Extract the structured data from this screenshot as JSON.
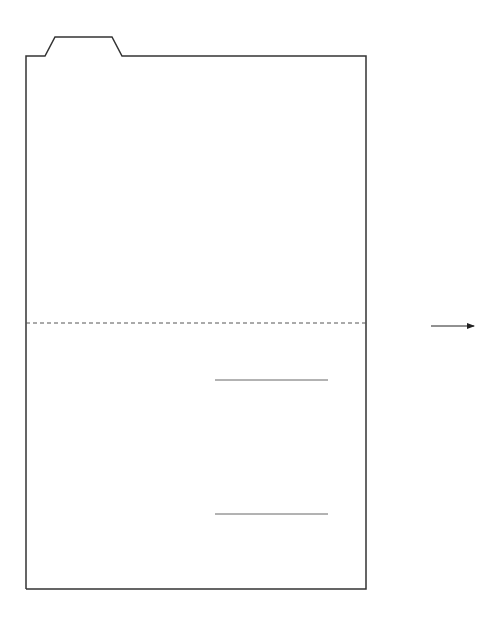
{
  "diagram": {
    "title": "",
    "stroke_color": "#333333",
    "line_color": "#555555",
    "background": "#ffffff",
    "folder": {
      "outline_points": "26,589 26,56 45,56 55,37 112,37 122,56 366,56 366,589 26,589",
      "fold_line": {
        "x1": 26,
        "y1": 323,
        "x2": 366,
        "y2": 323,
        "style": "dashed"
      }
    },
    "signature_lines": [
      {
        "x1": 215,
        "y1": 380,
        "x2": 328,
        "y2": 380
      },
      {
        "x1": 215,
        "y1": 514,
        "x2": 328,
        "y2": 514
      }
    ],
    "arrow": {
      "x1": 431,
      "y1": 326,
      "x2": 474,
      "y2": 326,
      "direction": "right-arrow"
    }
  }
}
